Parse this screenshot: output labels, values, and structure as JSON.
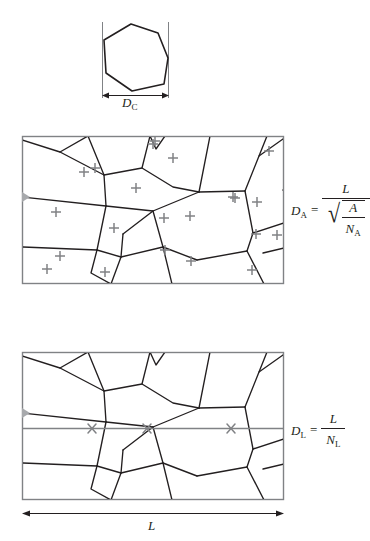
{
  "figure": {
    "background_color": "#ffffff",
    "line_color": "#231f20",
    "frame_color": "#808285",
    "mark_color": "#808285"
  },
  "panels": {
    "top": {
      "name": "single-grain-panel",
      "caption_label": "D",
      "caption_sub": "C",
      "dimension_label": "D_C",
      "shape": "heptagon",
      "polygon_points": "14,44 43,27 89,22 108,55 104,81 65,93 24,77",
      "guide_left_x": 102,
      "guide_right_x": 168,
      "guide_top_y": 22,
      "guide_bottom_y": 98,
      "arrow_y": 95,
      "arrow_x1": 103,
      "arrow_x2": 167
    },
    "middle": {
      "name": "planimetric-panel",
      "rect": {
        "x": 22,
        "y": 136,
        "w": 261,
        "h": 147
      },
      "formula": {
        "lhs_var": "D",
        "lhs_sub": "A",
        "equals": "=",
        "numerator": "L",
        "denominator_num": "A",
        "denominator_den_var": "N",
        "denominator_den_sub": "A",
        "radical": "√",
        "plain_text": "D_A = L / sqrt(A / N_A)"
      },
      "grain_count_marks": 20,
      "mark_glyph": "+"
    },
    "bottom": {
      "name": "lineal-intercept-panel",
      "rect": {
        "x": 22,
        "y": 352,
        "w": 261,
        "h": 147
      },
      "formula": {
        "lhs_var": "D",
        "lhs_sub": "L",
        "equals": "=",
        "numerator": "L",
        "denominator_var": "N",
        "denominator_sub": "L",
        "plain_text": "D_L = L / N_L"
      },
      "test_line_y": 428,
      "intercept_glyph": "×",
      "intercept_count": 3,
      "intercept_x": [
        92,
        147,
        231
      ],
      "length_label": "L",
      "length_arrow": {
        "y": 513,
        "x1": 22,
        "x2": 283
      },
      "length_label_pos": {
        "x": 152,
        "y": 527
      }
    }
  },
  "geometry": {
    "middle_plus_marks": [
      [
        152,
        140
      ],
      [
        84,
        160
      ],
      [
        273,
        161
      ],
      [
        43,
        157
      ],
      [
        118,
        183
      ],
      [
        184,
        170
      ],
      [
        236,
        190
      ],
      [
        63,
        215
      ],
      [
        122,
        242
      ],
      [
        168,
        220
      ],
      [
        189,
        240
      ],
      [
        242,
        240
      ],
      [
        257,
        255
      ],
      [
        276,
        248
      ],
      [
        46,
        267
      ],
      [
        107,
        272
      ],
      [
        194,
        262
      ],
      [
        246,
        268
      ],
      [
        277,
        220
      ],
      [
        100,
        246
      ]
    ],
    "grain_network_middle": [
      "M22,141 L58,151 L86,136",
      "M58,151 L103,174 L105,205",
      "M103,174 L141,167",
      "M141,167 L149,136",
      "M22,196 L105,205",
      "M105,205 L96,249",
      "M105,205 L152,210 L198,191",
      "M141,167 L172,186 L198,191",
      "M198,191 L244,190",
      "M244,190 L258,155 L283,140",
      "M244,190 L252,232",
      "M152,210 L162,246 L196,259",
      "M196,259 L246,250",
      "M252,232 L246,250",
      "M246,250 L263,283",
      "M252,232 L283,222",
      "M22,246 L96,249",
      "M96,249 L90,272 L110,283",
      "M96,249 L120,256 L122,233",
      "M122,233 L152,210",
      "M120,256 L162,246",
      "M120,256 L110,283",
      "M162,246 L171,283",
      "M283,247 L262,252",
      "M149,136 L155,148 L164,136",
      "M258,155 L266,136"
    ]
  },
  "colors": {
    "ink": "#231f20",
    "frame": "#808285",
    "plus": "#808285",
    "cross": "#808285",
    "testline": "#808285"
  }
}
